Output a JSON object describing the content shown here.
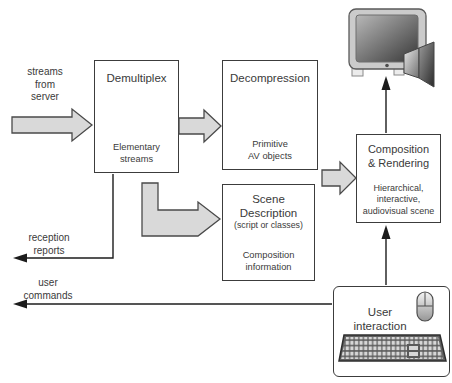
{
  "diagram": {
    "boxes": {
      "demultiplex": {
        "title": "Demultiplex",
        "note": "Elementary\nstreams"
      },
      "decompression": {
        "title": "Decompression",
        "note": "Primitive\nAV objects"
      },
      "scene_description": {
        "title": "Scene\nDescription",
        "subtitle": "(script or classes)",
        "note": "Composition\ninformation"
      },
      "composition_rendering": {
        "title": "Composition\n& Rendering",
        "note": "Hierarchical,\ninteractive,\naudiovisual scene"
      },
      "user_interaction": {
        "title": "User\ninteraction"
      }
    },
    "arrow_labels": {
      "streams_from_server": "streams\nfrom\nserver",
      "reception_reports": "reception\nreports",
      "user_commands": "user\ncommands"
    },
    "icons": {
      "display": "monitor-icon",
      "audio": "speaker-icon",
      "pointing_device": "mouse-icon",
      "text_input": "keyboard-icon"
    },
    "colors": {
      "background": "#ffffff",
      "box_fill": "#ffffff",
      "box_border": "#3c3c3c",
      "block_arrow_fill": "#d9d9d9",
      "block_arrow_outline": "#4a4a4a",
      "thin_arrow": "#1c1c1c",
      "text": "#3a3a3a"
    }
  }
}
